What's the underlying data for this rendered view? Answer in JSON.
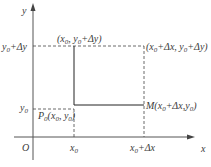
{
  "diagram": {
    "axes": {
      "x_label": "x",
      "y_label": "y",
      "origin_label": "O"
    },
    "x_ticks": [
      {
        "base": "x",
        "sub": "0",
        "rest": ""
      },
      {
        "base": "x",
        "sub": "0",
        "rest": "+Δx"
      }
    ],
    "y_ticks": [
      {
        "base": "y",
        "sub": "0",
        "rest": ""
      },
      {
        "base": "y",
        "sub": "0",
        "rest": "+Δy"
      }
    ],
    "points": {
      "p0": {
        "prefix": "P",
        "prefix_sub": "0",
        "text": "(x",
        "s1": "0",
        "mid": ", y",
        "s2": "0",
        "end": ")"
      },
      "top_left": {
        "text": "(x",
        "s1": "0",
        "mid": ", y",
        "s2": "0",
        "end": "+Δy)"
      },
      "top_right": {
        "text": "(x",
        "s1": "0",
        "mid": "+Δx, y",
        "s2": "0",
        "end": "+Δy)"
      },
      "m": {
        "prefix": "M",
        "text": "(x",
        "s1": "0",
        "mid": "+Δx,y",
        "s2": "0",
        "end": ")"
      }
    },
    "colors": {
      "line": "#222222",
      "text": "#3a3a3a"
    }
  }
}
